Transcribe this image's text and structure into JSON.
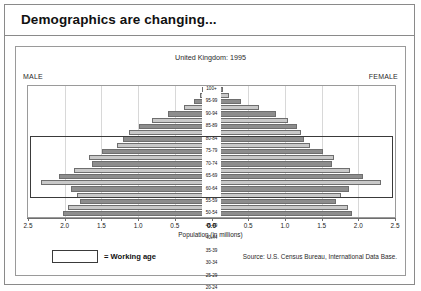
{
  "slide": {
    "title": "Demographics are changing..."
  },
  "chart_panel": {
    "male_label": "MALE",
    "female_label": "FEMALE",
    "legend": {
      "swatch_name": "working-age-swatch",
      "text": "= Working age"
    },
    "source": "Source: U.S. Census Bureau, International Data Base."
  },
  "chart_data": {
    "type": "bar",
    "subtype": "population-pyramid",
    "title": "United Kingdom: 1995",
    "xlabel": "Population (in millions)",
    "ylabel": "",
    "xlim": [
      -2.5,
      2.5
    ],
    "xticks": [
      2.5,
      2.0,
      1.5,
      1.0,
      0.5,
      0.0,
      0.5,
      1.0,
      1.5,
      2.0,
      2.5
    ],
    "xtick_labels": [
      "2.5",
      "2.0",
      "1.5",
      "1.0",
      "0.5",
      "0.0",
      "0.0",
      "0.5",
      "1.0",
      "1.5",
      "2.0",
      "2.5"
    ],
    "grid": true,
    "legend_position": "below-left",
    "categories": [
      "100+",
      "95-99",
      "90-94",
      "85-89",
      "80-84",
      "75-79",
      "70-74",
      "65-69",
      "60-64",
      "55-59",
      "50-54",
      "45-49",
      "40-44",
      "35-39",
      "30-34",
      "25-29",
      "20-24",
      "15-19",
      "10-14",
      "5-9",
      "0-4"
    ],
    "series": [
      {
        "name": "MALE",
        "side": "left",
        "values": [
          0.01,
          0.04,
          0.12,
          0.27,
          0.49,
          0.72,
          0.91,
          1.05,
          1.14,
          1.23,
          1.44,
          1.62,
          1.58,
          1.84,
          2.05,
          2.32,
          1.88,
          1.8,
          1.75,
          1.92,
          2.0
        ]
      },
      {
        "name": "FEMALE",
        "side": "right",
        "values": [
          0.03,
          0.12,
          0.3,
          0.55,
          0.8,
          0.97,
          1.09,
          1.16,
          1.2,
          1.28,
          1.47,
          1.63,
          1.6,
          1.85,
          2.04,
          2.3,
          1.84,
          1.72,
          1.66,
          1.82,
          1.88
        ]
      }
    ],
    "working_age_band": [
      "15-19",
      "60-64"
    ],
    "bar_colors": {
      "dark": "#8d8d8d",
      "light": "#c9c9c9"
    }
  }
}
